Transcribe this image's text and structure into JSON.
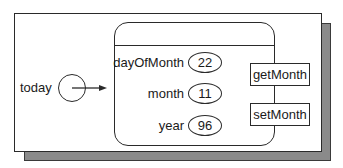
{
  "diagram": {
    "variable": {
      "name": "today"
    },
    "object": {
      "fields": [
        {
          "label": "dayOfMonth",
          "value": "22"
        },
        {
          "label": "month",
          "value": "11"
        },
        {
          "label": "year",
          "value": "96"
        }
      ],
      "methods": [
        {
          "label": "getMonth"
        },
        {
          "label": "setMonth"
        }
      ]
    },
    "colors": {
      "line": "#2a2a2a",
      "shadow": "#8a8a8a",
      "background": "#ffffff"
    }
  }
}
